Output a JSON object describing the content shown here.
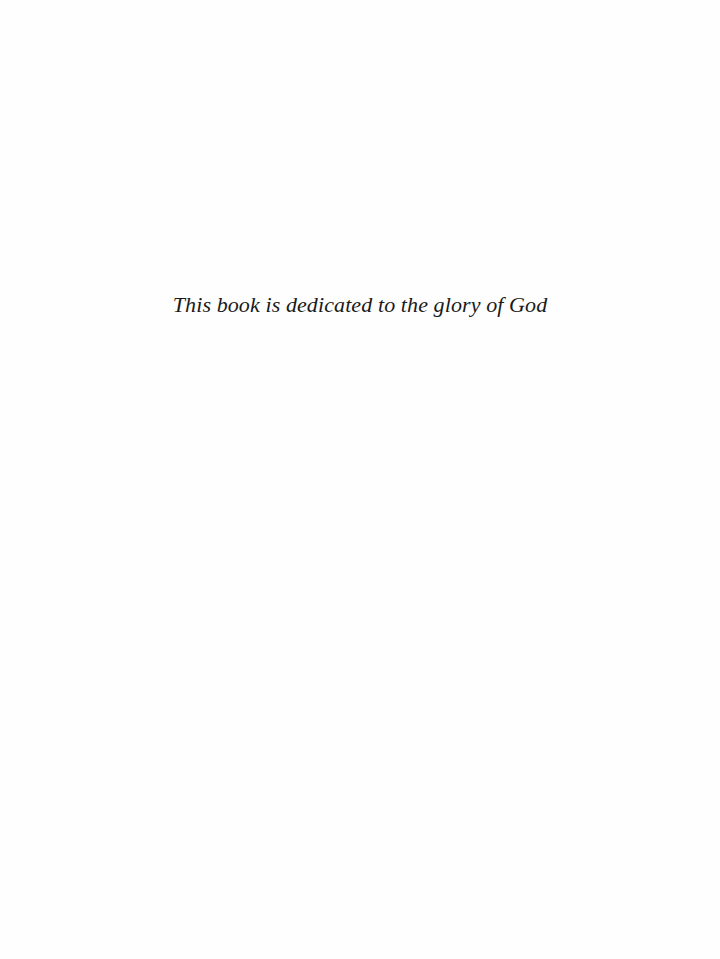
{
  "page": {
    "dedication": "This book is dedicated to the glory of God"
  }
}
